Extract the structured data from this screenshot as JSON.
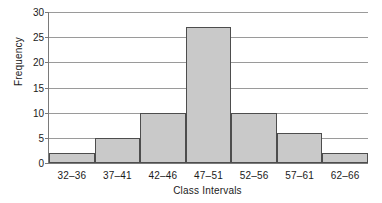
{
  "chart_data": {
    "type": "bar",
    "title": "",
    "xlabel": "Class Intervals",
    "ylabel": "Frequency",
    "categories": [
      "32–36",
      "37–41",
      "42–46",
      "47–51",
      "52–56",
      "57–61",
      "62–66"
    ],
    "values": [
      2,
      5,
      10,
      27,
      10,
      6,
      2
    ],
    "ylim": [
      0,
      30
    ],
    "yticks": [
      0,
      5,
      10,
      15,
      20,
      25,
      30
    ],
    "ytick_labels": [
      "0",
      "5",
      "10",
      "15",
      "20",
      "25",
      "30"
    ],
    "grid": true,
    "legend": false,
    "bar_fill_color": "#c9c9c9",
    "bar_edge_color": "#4d4d4d",
    "axis_color": "#7a7a7a",
    "grid_color": "#9a9a9a",
    "background_color": "#ffffff"
  }
}
